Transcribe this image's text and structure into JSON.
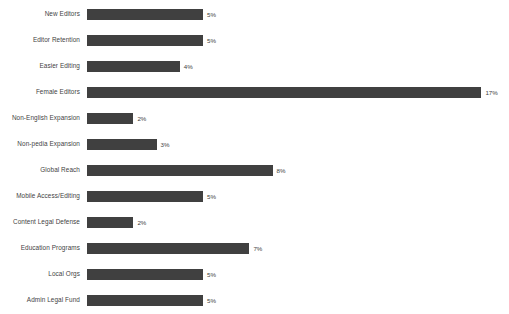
{
  "chart_data": {
    "type": "bar",
    "orientation": "horizontal",
    "title": "",
    "subtitle": "",
    "xlabel": "",
    "ylabel": "",
    "grid": false,
    "legend": null,
    "xlim": [
      0,
      18
    ],
    "value_suffix": "%",
    "bar_color": "#404040",
    "label_color": "#3f3f3f",
    "background": "#ffffff",
    "categories": [
      "New Editors",
      "Editor Retention",
      "Easier Editing",
      "Female Editors",
      "Non-English Expansion",
      "Non-pedia Expansion",
      "Global Reach",
      "Mobile Access/Editing",
      "Content Legal Defense",
      "Education Programs",
      "Local Orgs",
      "Admin Legal Fund"
    ],
    "values": [
      5,
      5,
      4,
      17,
      2,
      3,
      8,
      5,
      2,
      7,
      5,
      5
    ],
    "data_labels": [
      "5%",
      "5%",
      "4%",
      "17%",
      "2%",
      "3%",
      "8%",
      "5%",
      "2%",
      "7%",
      "5%",
      "5%"
    ]
  }
}
